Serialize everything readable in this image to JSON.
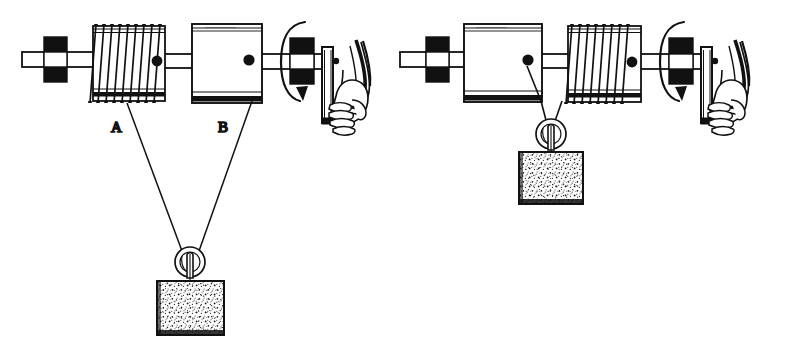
{
  "figure": {
    "background_color": "#ffffff",
    "ink_color": "#111111",
    "width": 792,
    "height": 341,
    "labels": [
      {
        "id": "label-a",
        "text": "A",
        "x": 117,
        "y": 128,
        "describes": "coiled-drum-left"
      },
      {
        "id": "label-b",
        "text": "B",
        "x": 223,
        "y": 128,
        "describes": "smooth-drum-left"
      }
    ],
    "panels": [
      {
        "id": "panel-left",
        "name": "left-apparatus",
        "origin_x": 0,
        "drum_order": [
          "coiled",
          "smooth"
        ],
        "pulley": {
          "x": 190,
          "y": 260,
          "radius": 14
        },
        "weight": {
          "x": 156,
          "y": 280,
          "width": 68,
          "height": 55,
          "fill": "stippled"
        },
        "cords": [
          {
            "from_x": 128,
            "from_y": 103,
            "to_x": 181,
            "to_y": 252
          },
          {
            "from_x": 253,
            "from_y": 103,
            "to_x": 200,
            "to_y": 252
          }
        ],
        "bearing_blocks": [
          {
            "x": 44,
            "y": 40
          },
          {
            "x": 293,
            "y": 42
          }
        ],
        "rotation_arrow": {
          "cx": 303,
          "cy": 62,
          "direction": "counter-clockwise"
        },
        "crank": {
          "x": 324,
          "y": 48
        },
        "hand": {
          "x": 336,
          "y": 70
        }
      },
      {
        "id": "panel-right",
        "name": "right-apparatus",
        "origin_x": 396,
        "drum_order": [
          "smooth",
          "coiled"
        ],
        "pulley": {
          "x": 551,
          "y": 133,
          "radius": 14
        },
        "weight": {
          "x": 519,
          "y": 150,
          "width": 64,
          "height": 52,
          "fill": "stippled"
        },
        "cords": [
          {
            "from_x": 547,
            "from_y": 68,
            "to_x": 547,
            "to_y": 124
          }
        ],
        "bearing_blocks": [
          {
            "x": 430,
            "y": 40
          },
          {
            "x": 672,
            "y": 42
          }
        ],
        "rotation_arrow": {
          "cx": 683,
          "cy": 62,
          "direction": "counter-clockwise"
        },
        "crank": {
          "x": 703,
          "y": 48
        },
        "hand": {
          "x": 715,
          "y": 70
        }
      }
    ],
    "parts_glossary": [
      {
        "name": "coiled-drum",
        "description": "cylinder wrapped with rope coils"
      },
      {
        "name": "smooth-drum",
        "description": "plain large cylinder"
      },
      {
        "name": "axle-shaft",
        "description": "horizontal shaft through drums"
      },
      {
        "name": "bearing-block",
        "description": "solid black support block"
      },
      {
        "name": "crank-handle",
        "description": "vertical crank bar turned by hand"
      },
      {
        "name": "hand",
        "description": "fist gripping crank handle"
      },
      {
        "name": "movable-pulley",
        "description": "sheave carrying the load"
      },
      {
        "name": "weight-block",
        "description": "suspended square load"
      },
      {
        "name": "rotation-arrow",
        "description": "elliptical arrow showing shaft rotation"
      }
    ]
  }
}
